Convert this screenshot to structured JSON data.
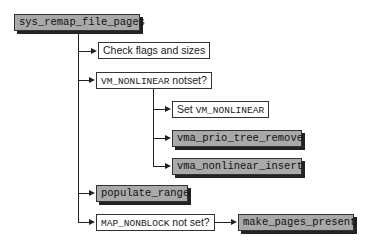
{
  "diagram": {
    "root": "sys_remap_file_pages",
    "steps": [
      {
        "label": "Check flags and sizes",
        "type": "text"
      },
      {
        "label_code": "VM_NONLINEAR",
        "label_text": " notset?",
        "type": "condition",
        "children": [
          {
            "label_text": "Set ",
            "label_code": "VM_NONLINEAR",
            "type": "text"
          },
          {
            "label": "vma_prio_tree_remove",
            "type": "function"
          },
          {
            "label": "vma_nonlinear_insert",
            "type": "function"
          }
        ]
      },
      {
        "label": "populate_range",
        "type": "function"
      },
      {
        "label_code": "MAP_NONBLOCK",
        "label_text": " not set?",
        "type": "condition",
        "then": {
          "label": "make_pages_present",
          "type": "function"
        }
      }
    ]
  },
  "colors": {
    "function_fill": "#a9a9a9",
    "text_fill": "#ffffff",
    "line": "#222222"
  }
}
